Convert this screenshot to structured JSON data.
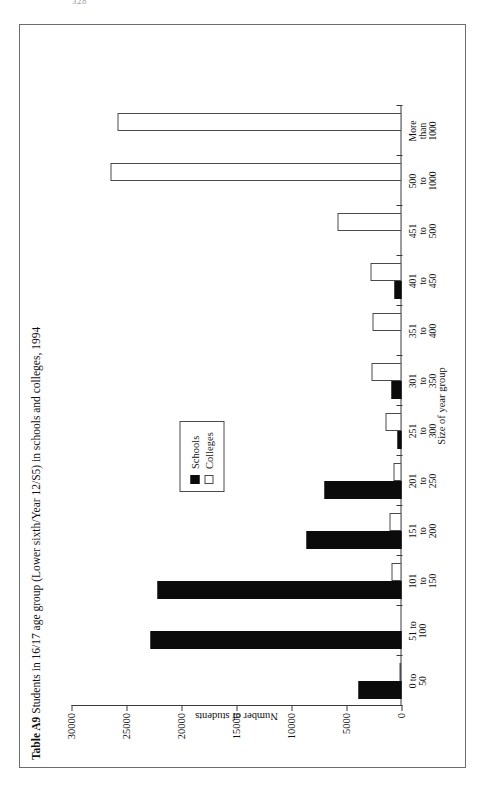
{
  "page_number": "328",
  "figure": {
    "title_prefix": "Table A9",
    "title_rest": " Students in 16/17 age group (Lower sixth/Year 12/S5) in schools and colleges, 1994"
  },
  "legend": {
    "position": "inside-plot",
    "items": [
      {
        "label": "Schools",
        "color": "#0b0b0b",
        "style": "filled"
      },
      {
        "label": "Colleges",
        "color": "#ffffff",
        "style": "outline"
      }
    ]
  },
  "chart_data": {
    "type": "bar",
    "orientation": "vertical-on-rotated-page",
    "title": "Table A9 Students in 16/17 age group (Lower sixth/Year 12/S5) in schools and colleges, 1994",
    "xlabel": "Size of year group",
    "ylabel": "Number of students",
    "ylim": [
      0,
      30000
    ],
    "yticks": [
      0,
      5000,
      10000,
      15000,
      20000,
      25000,
      30000
    ],
    "ytick_labels": [
      "0",
      "5000",
      "10000",
      "15000",
      "20000",
      "25000",
      "30000"
    ],
    "grid": false,
    "categories": [
      "0 to\n50",
      "51 to\n100",
      "101\nto\n150",
      "151\nto\n200",
      "201\nto\n250",
      "251\nto\n300",
      "301\nto\n350",
      "351\nto\n400",
      "401\nto\n450",
      "451\nto\n500",
      "500\nto\n1000",
      "More\nthan\n1000"
    ],
    "series": [
      {
        "name": "Schools",
        "color": "#0b0b0b",
        "values": [
          3900,
          22800,
          22200,
          8600,
          7000,
          400,
          900,
          0,
          600,
          0,
          0,
          0
        ]
      },
      {
        "name": "Colleges",
        "color": "#ffffff",
        "values": [
          200,
          0,
          900,
          1100,
          700,
          1500,
          2700,
          2600,
          2800,
          5800,
          26500,
          25800
        ]
      }
    ]
  }
}
